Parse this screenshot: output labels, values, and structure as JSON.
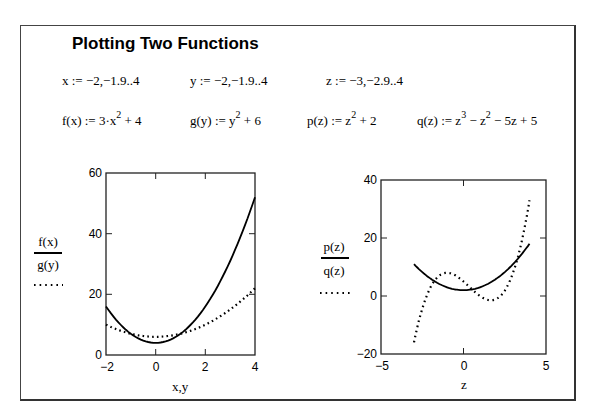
{
  "title": "Plotting Two Functions",
  "definitions": {
    "x_range": "x := −2,−1.9..4",
    "y_range": "y := −2,−1.9..4",
    "z_range": "z := −3,−2.9..4",
    "f_lhs": "f(x) := 3·x",
    "f_exp": "2",
    "f_rest": " + 4",
    "g_lhs": "g(y) := y",
    "g_exp": "2",
    "g_rest": " + 6",
    "p_lhs": "p(z) := z",
    "p_exp": "2",
    "p_rest": " + 2",
    "q_lhs": "q(z) := z",
    "q_exp1": "3",
    "q_mid": " − z",
    "q_exp2": "2",
    "q_rest": " − 5z + 5"
  },
  "plots": {
    "left": {
      "legend_top": "f(x)",
      "legend_bottom": "g(y)",
      "xlabel": "x,y",
      "xticks": [
        "−2",
        "0",
        "2",
        "4"
      ],
      "yticks": [
        "0",
        "20",
        "40",
        "60"
      ]
    },
    "right": {
      "legend_top": "p(z)",
      "legend_bottom": "q(z)",
      "xlabel": "z",
      "xticks": [
        "−5",
        "0",
        "5"
      ],
      "yticks": [
        "−20",
        "0",
        "20",
        "40"
      ]
    }
  },
  "chart_data": [
    {
      "type": "line",
      "title": "",
      "xlabel": "x,y",
      "ylabel": "",
      "xlim": [
        -2,
        4
      ],
      "ylim": [
        0,
        60
      ],
      "grid": false,
      "legend_position": "left",
      "series": [
        {
          "name": "f(x)",
          "style": "solid",
          "formula": "3x^2+4",
          "x": [
            -2,
            -1,
            0,
            1,
            2,
            3,
            4
          ],
          "values": [
            16,
            7,
            4,
            7,
            16,
            31,
            52
          ]
        },
        {
          "name": "g(y)",
          "style": "dotted",
          "formula": "y^2+6",
          "x": [
            -2,
            -1,
            0,
            1,
            2,
            3,
            4
          ],
          "values": [
            10,
            7,
            6,
            7,
            10,
            15,
            22
          ]
        }
      ]
    },
    {
      "type": "line",
      "title": "",
      "xlabel": "z",
      "ylabel": "",
      "xlim": [
        -5,
        5
      ],
      "ylim": [
        -20,
        40
      ],
      "grid": false,
      "legend_position": "left",
      "series": [
        {
          "name": "p(z)",
          "style": "solid",
          "formula": "z^2+2",
          "x": [
            -3,
            -2,
            -1,
            0,
            1,
            2,
            3,
            4
          ],
          "values": [
            11,
            6,
            3,
            2,
            3,
            6,
            11,
            18
          ]
        },
        {
          "name": "q(z)",
          "style": "dotted",
          "formula": "z^3-z^2-5z+5",
          "x": [
            -3,
            -2,
            -1,
            0,
            1,
            2,
            3,
            4
          ],
          "values": [
            -16,
            3,
            8,
            5,
            0,
            -1,
            8,
            33
          ]
        }
      ]
    }
  ]
}
